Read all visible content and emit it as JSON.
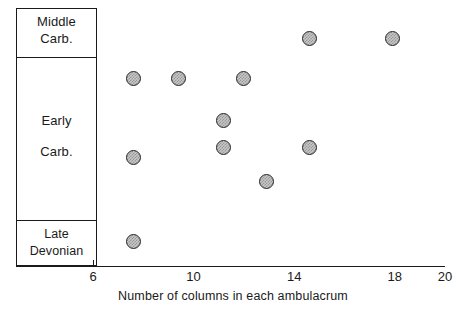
{
  "chart_data": {
    "type": "scatter",
    "title": "",
    "xlabel": "Number of columns in each ambulacrum",
    "ylabel": "",
    "xlim": [
      5.0,
      20.0
    ],
    "xticks": [
      6,
      10,
      14,
      18,
      20
    ],
    "xtick_labels": [
      "6",
      "10",
      "14",
      "18",
      "20"
    ],
    "grid": false,
    "legend": null,
    "y_categories": [
      "Middle Carb.",
      "Early Carb.",
      "Late Devonian"
    ],
    "points": [
      {
        "x": 14.6,
        "y_category": "Middle Carb.",
        "py": 38
      },
      {
        "x": 17.9,
        "y_category": "Middle Carb.",
        "py": 38
      },
      {
        "x": 7.6,
        "y_category": "Early Carb.",
        "py": 78
      },
      {
        "x": 9.4,
        "y_category": "Early Carb.",
        "py": 78
      },
      {
        "x": 12.0,
        "y_category": "Early Carb.",
        "py": 78
      },
      {
        "x": 11.2,
        "y_category": "Early Carb.",
        "py": 120
      },
      {
        "x": 11.2,
        "y_category": "Early Carb.",
        "py": 147
      },
      {
        "x": 14.6,
        "y_category": "Early Carb.",
        "py": 147
      },
      {
        "x": 7.6,
        "y_category": "Early Carb.",
        "py": 157
      },
      {
        "x": 12.9,
        "y_category": "Early Carb.",
        "py": 181
      },
      {
        "x": 7.6,
        "y_category": "Late Devonian",
        "py": 241
      }
    ],
    "marker_style": {
      "shape": "circle",
      "fill": "#c6c6c6",
      "edge": "#262626",
      "hatch": "crosshatch"
    }
  },
  "axis": {
    "x_title": "Number of columns in each ambulacrum",
    "ticks": [
      {
        "value": 6,
        "label": "6"
      },
      {
        "value": 10,
        "label": "10"
      },
      {
        "value": 14,
        "label": "14"
      },
      {
        "value": 18,
        "label": "18"
      },
      {
        "value": 20,
        "label": "20"
      }
    ]
  },
  "strat_column": {
    "cells": [
      {
        "id": "middle-carb",
        "line1": "Middle",
        "line2": "Carb."
      },
      {
        "id": "early-carb",
        "line1": "Early",
        "line2": "Carb."
      },
      {
        "id": "late-devonian",
        "line1": "Late",
        "line2": "Devonian"
      }
    ]
  },
  "colors": {
    "ink": "#1a1a1a",
    "marker_fill": "#c6c6c6",
    "marker_edge": "#262626",
    "background": "#ffffff"
  }
}
